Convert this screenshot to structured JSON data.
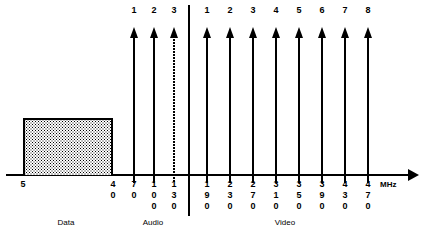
{
  "diagram": {
    "axis": {
      "unit_label": "MHz",
      "start_label": "5"
    },
    "sections": [
      {
        "key": "data",
        "caption": "Data",
        "left": 36,
        "width": 60
      },
      {
        "key": "audio",
        "caption": "Audio",
        "left": 123,
        "width": 60
      },
      {
        "key": "video",
        "caption": "Video",
        "left": 255,
        "width": 60
      }
    ],
    "data_block": {
      "start_freq": "5",
      "end_freq": "40",
      "fill": "stipple"
    },
    "carriers": [
      {
        "group": "audio",
        "index": "1",
        "freq": "70",
        "x": 133,
        "dotted": false
      },
      {
        "group": "audio",
        "index": "2",
        "freq": "100",
        "x": 153,
        "dotted": false
      },
      {
        "group": "audio",
        "index": "3",
        "freq": "130",
        "x": 173,
        "dotted": true
      },
      {
        "group": "video",
        "index": "1",
        "freq": "190",
        "x": 206,
        "dotted": false
      },
      {
        "group": "video",
        "index": "2",
        "freq": "230",
        "x": 229,
        "dotted": false
      },
      {
        "group": "video",
        "index": "3",
        "freq": "270",
        "x": 252,
        "dotted": false
      },
      {
        "group": "video",
        "index": "4",
        "freq": "310",
        "x": 275,
        "dotted": false
      },
      {
        "group": "video",
        "index": "5",
        "freq": "350",
        "x": 298,
        "dotted": false
      },
      {
        "group": "video",
        "index": "6",
        "freq": "390",
        "x": 321,
        "dotted": false
      },
      {
        "group": "video",
        "index": "7",
        "freq": "430",
        "x": 344,
        "dotted": false
      },
      {
        "group": "video",
        "index": "8",
        "freq": "470",
        "x": 367,
        "dotted": false
      }
    ],
    "edge_labels": [
      {
        "text": "5",
        "x": 23
      },
      {
        "text": "40",
        "x": 113
      }
    ],
    "colors": {
      "ink": "#000000",
      "paper": "#ffffff"
    }
  }
}
